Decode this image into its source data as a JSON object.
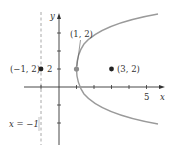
{
  "figure": {
    "type": "parabola-focus-directrix",
    "equation": "(y-2)^2 = 8(x-1)",
    "colors": {
      "axis": "#333333",
      "curve": "#9a9a9a",
      "directrix": "#a8a8a8",
      "vertex_point": "#8c8c8c",
      "focus_point": "#222222"
    },
    "axes": {
      "x_label": "x",
      "y_label": "y",
      "x_tick_label": "5",
      "y_tick_label": "2"
    },
    "directrix": {
      "label": "x = −1",
      "x": -1
    },
    "points": {
      "vertex": {
        "label": "(1, 2)",
        "x": 1,
        "y": 2
      },
      "focus": {
        "label": "(3, 2)",
        "x": 3,
        "y": 2
      },
      "directrix_point": {
        "label": "(−1, 2)",
        "x": -1,
        "y": 2
      }
    }
  }
}
